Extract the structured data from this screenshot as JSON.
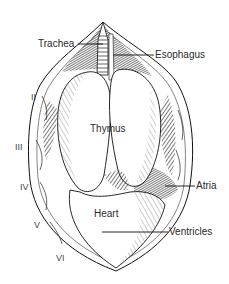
{
  "figure": {
    "labels": {
      "trachea": "Trachea",
      "esophagus": "Esophagus",
      "thymus": "Thymus",
      "atria": "Atria",
      "heart": "Heart",
      "ventricles": "Ventricles"
    },
    "ribs": [
      "II",
      "III",
      "IV",
      "V",
      "VI"
    ],
    "colors": {
      "ink": "#1a1a1a",
      "shade": "#3a3a3a",
      "paper": "#ffffff"
    }
  }
}
